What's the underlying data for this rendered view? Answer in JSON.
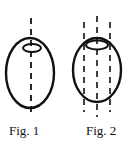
{
  "figures": [
    {
      "id": "fig1",
      "caption": "Fig. 1",
      "description": "Ellipsoid with single dashed vertical axis and rotation arrow loop at top",
      "axes_count": 1
    },
    {
      "id": "fig2",
      "caption": "Fig. 2",
      "description": "Ellipsoid with three parallel dashed vertical axes and rotation loop at top",
      "axes_count": 3
    }
  ],
  "colors": {
    "stroke": "#111111",
    "background": "#ffffff"
  }
}
